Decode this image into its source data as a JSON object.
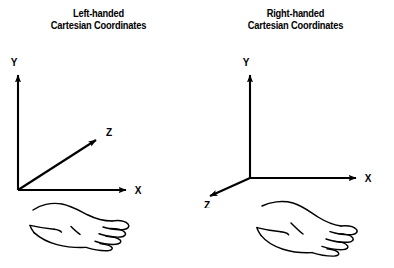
{
  "figure": {
    "background_color": "#ffffff",
    "stroke_color": "#000000",
    "panel_count": 2
  },
  "panels": [
    {
      "id": "left-handed",
      "title_line1": "Left-handed",
      "title_line2": "Cartesian Coordinates",
      "axes": {
        "y_label": "Y",
        "x_label": "X",
        "z_label": "Z",
        "y_direction": "up",
        "x_direction": "right",
        "z_direction": "up-right-diagonal"
      },
      "hand": {
        "name": "left-hand-illustration",
        "description": "Open left hand, palm up, fingers pointing right"
      }
    },
    {
      "id": "right-handed",
      "title_line1": "Right-handed",
      "title_line2": "Cartesian Coordinates",
      "axes": {
        "y_label": "Y",
        "x_label": "X",
        "z_label": "Z",
        "y_direction": "up",
        "x_direction": "right",
        "z_direction": "down-left-diagonal"
      },
      "hand": {
        "name": "right-hand-illustration",
        "description": "Open right hand, palm up, fingers pointing right"
      }
    }
  ]
}
